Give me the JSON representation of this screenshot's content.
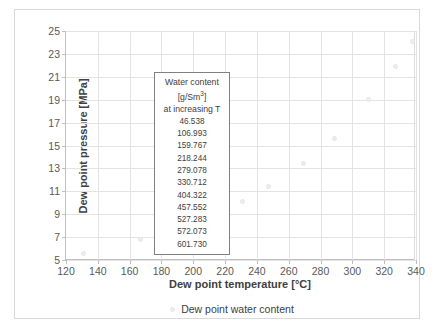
{
  "chart_data": {
    "type": "scatter",
    "title": "",
    "xlabel": "Dew point temperature [°C]",
    "ylabel": "Dew point pressure [MPa]",
    "xlim": [
      120,
      340
    ],
    "ylim": [
      5,
      25
    ],
    "xticks": [
      120,
      140,
      160,
      180,
      200,
      220,
      240,
      260,
      280,
      300,
      320,
      340
    ],
    "yticks": [
      5,
      7,
      9,
      11,
      13,
      15,
      17,
      19,
      21,
      23,
      25
    ],
    "grid": true,
    "legend_position": "bottom",
    "series": [
      {
        "name": "Dew point water content",
        "marker_color": "#ededee",
        "x": [
          131,
          167,
          190,
          212,
          231,
          247,
          269,
          289,
          310,
          327,
          338
        ],
        "y": [
          5.6,
          6.8,
          7.7,
          8.9,
          10.1,
          11.4,
          13.4,
          15.6,
          19.0,
          21.9,
          24.1
        ],
        "water_content_g_per_Sm3": [
          46.538,
          106.993,
          159.767,
          218.244,
          279.078,
          330.712,
          404.322,
          457.552,
          527.283,
          572.073,
          601.73
        ]
      }
    ],
    "annotation": {
      "line1": "Water content",
      "line2_prefix": "[g/Sm",
      "line2_sup": "3",
      "line2_suffix": "]",
      "line3": "at increasing T",
      "values": [
        "46.538",
        "106.993",
        "159.767",
        "218.244",
        "279.078",
        "330.712",
        "404.322",
        "457.552",
        "527.283",
        "572.073",
        "601.730"
      ]
    }
  },
  "legend": {
    "entries": [
      {
        "label": "Dew point water content"
      }
    ]
  },
  "axes": {
    "x": {
      "title": "Dew point temperature [°C]",
      "tick_labels": [
        "120",
        "140",
        "160",
        "180",
        "200",
        "220",
        "240",
        "260",
        "280",
        "300",
        "320",
        "340"
      ]
    },
    "y": {
      "title": "Dew point pressure [MPa]",
      "tick_labels": [
        "5",
        "7",
        "9",
        "11",
        "13",
        "15",
        "17",
        "19",
        "21",
        "23",
        "25"
      ]
    }
  },
  "colors": {
    "marker": "#ededee",
    "gridline": "#e3e3e3",
    "axis": "#bfbfbf",
    "frame": "#d9d9d9",
    "text": "#404040",
    "tick_text": "#595959",
    "annotation_border": "#808080",
    "background": "#ffffff"
  }
}
